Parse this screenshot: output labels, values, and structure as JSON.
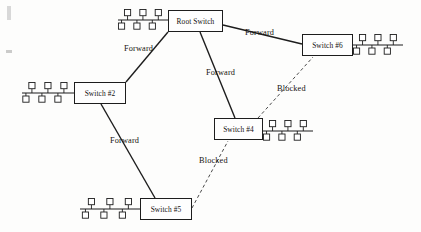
{
  "diagram": {
    "type": "network-topology",
    "canvas": {
      "width": 421,
      "height": 232
    },
    "colors": {
      "ink": "#1d1d1d",
      "background": "#fdfdfc",
      "blocked_link": "#4a4a4a"
    },
    "nodes": [
      {
        "id": "root",
        "label": "Root Switch",
        "x": 168,
        "y": 10,
        "w": 55,
        "h": 22,
        "hosts": {
          "count": 3,
          "side": "left",
          "bus_x": 118,
          "bus_y": 20,
          "bus_len": 50
        }
      },
      {
        "id": "switch2",
        "label": "Switch #2",
        "x": 74,
        "y": 82,
        "w": 52,
        "h": 22,
        "hosts": {
          "count": 3,
          "side": "left",
          "bus_x": 22,
          "bus_y": 93,
          "bus_len": 52
        }
      },
      {
        "id": "switch6",
        "label": "Switch #6",
        "x": 302,
        "y": 34,
        "w": 51,
        "h": 22,
        "hosts": {
          "count": 3,
          "side": "right",
          "bus_x": 353,
          "bus_y": 45,
          "bus_len": 50
        }
      },
      {
        "id": "switch4",
        "label": "Switch #4",
        "x": 214,
        "y": 118,
        "w": 49,
        "h": 22,
        "hosts": {
          "count": 3,
          "side": "right",
          "bus_x": 263,
          "bus_y": 131,
          "bus_len": 50
        }
      },
      {
        "id": "switch5",
        "label": "Switch #5",
        "x": 140,
        "y": 198,
        "w": 52,
        "h": 22,
        "hosts": {
          "count": 3,
          "side": "left",
          "bus_x": 80,
          "bus_y": 209,
          "bus_len": 60
        }
      }
    ],
    "links": [
      {
        "id": "root-switch2",
        "from": "root",
        "to": "switch2",
        "state": "Forward",
        "style": "solid",
        "x1": 168,
        "y1": 32,
        "x2": 126,
        "y2": 82,
        "label_x": 124,
        "label_y": 44
      },
      {
        "id": "root-switch6",
        "from": "root",
        "to": "switch6",
        "state": "Forward",
        "style": "solid",
        "x1": 223,
        "y1": 25,
        "x2": 302,
        "y2": 44,
        "label_x": 245,
        "label_y": 28
      },
      {
        "id": "root-switch4",
        "from": "root",
        "to": "switch4",
        "state": "Forward",
        "style": "solid",
        "x1": 200,
        "y1": 32,
        "x2": 235,
        "y2": 118,
        "label_x": 206,
        "label_y": 68
      },
      {
        "id": "switch2-switch5",
        "from": "switch2",
        "to": "switch5",
        "state": "Forward",
        "style": "solid",
        "x1": 101,
        "y1": 104,
        "x2": 155,
        "y2": 198,
        "label_x": 110,
        "label_y": 136
      },
      {
        "id": "switch4-switch6",
        "from": "switch4",
        "to": "switch6",
        "state": "Blocked",
        "style": "dashed",
        "x1": 258,
        "y1": 118,
        "x2": 313,
        "y2": 57,
        "label_x": 277,
        "label_y": 84
      },
      {
        "id": "switch5-switch4",
        "from": "switch5",
        "to": "switch4",
        "state": "Blocked",
        "style": "dashed",
        "x1": 192,
        "y1": 208,
        "x2": 228,
        "y2": 141,
        "label_x": 199,
        "label_y": 156
      }
    ],
    "labels": {
      "forward": "Forward",
      "blocked": "Blocked"
    }
  }
}
